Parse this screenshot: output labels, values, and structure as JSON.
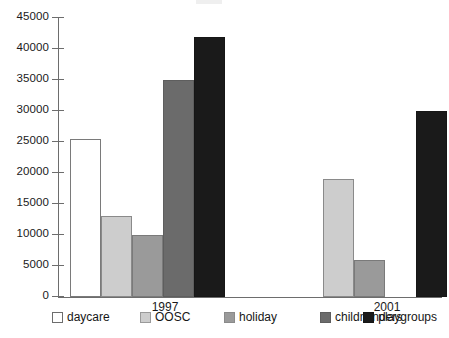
{
  "chart_data": {
    "type": "bar",
    "title": "",
    "xlabel": "",
    "ylabel": "",
    "categories": [
      "1997",
      "2001"
    ],
    "ylim": [
      0,
      45000
    ],
    "yticks": [
      0,
      5000,
      10000,
      15000,
      20000,
      25000,
      30000,
      35000,
      40000,
      45000
    ],
    "ytick_labels": [
      "0",
      "5000",
      "10000",
      "15000",
      "20000",
      "25000",
      "30000",
      "35000",
      "40000",
      "45000"
    ],
    "grid": false,
    "legend_position": "bottom",
    "series": [
      {
        "name": "daycare",
        "key": "daycare",
        "color": "#ffffff",
        "values": [
          25500,
          null
        ]
      },
      {
        "name": "OOSC",
        "key": "oosc",
        "color": "#cdcdcd",
        "values": [
          13000,
          19000
        ]
      },
      {
        "name": "holiday",
        "key": "holiday",
        "color": "#9a9a9a",
        "values": [
          10000,
          6000
        ]
      },
      {
        "name": "childminders",
        "key": "childminders",
        "color": "#6b6b6b",
        "values": [
          35000,
          null
        ]
      },
      {
        "name": "playgroups",
        "key": "playgroups",
        "color": "#1a1a1a",
        "values": [
          42000,
          30000
        ]
      }
    ]
  },
  "legend": {
    "items": [
      {
        "label": "daycare",
        "key": "daycare"
      },
      {
        "label": "OOSC",
        "key": "oosc"
      },
      {
        "label": "holiday",
        "key": "holiday"
      },
      {
        "label": "childminders",
        "key": "childminders"
      },
      {
        "label": "playgroups",
        "key": "playgroups"
      }
    ]
  }
}
